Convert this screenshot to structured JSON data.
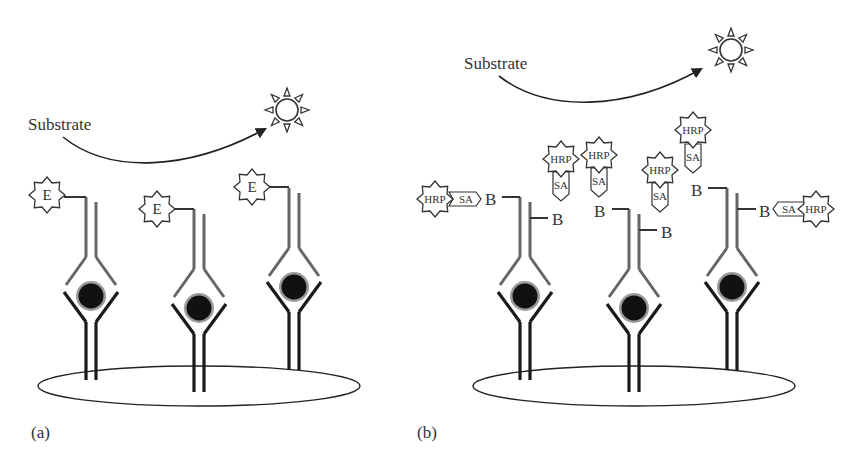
{
  "figure": {
    "panel_a": {
      "label": "(a)",
      "substrate_label": "Substrate",
      "enzyme_label": "E",
      "description": "Capture antibodies on a solid surface bind antigen; detection antibodies directly conjugated to enzyme (E) convert substrate to light signal",
      "antibodies": [
        {
          "x": 91,
          "offset": 0
        },
        {
          "x": 199,
          "offset": 12
        },
        {
          "x": 294,
          "offset": -10
        }
      ]
    },
    "panel_b": {
      "label": "(b)",
      "substrate_label": "Substrate",
      "biotin_label": "B",
      "streptavidin_label": "SA",
      "enzyme_label": "HRP",
      "description": "Biotinylated detection antibodies bind streptavidin-HRP conjugates, amplifying the signal",
      "antibodies": [
        {
          "x": 525,
          "offset": 0
        },
        {
          "x": 634,
          "offset": 12
        },
        {
          "x": 732,
          "offset": -10
        }
      ],
      "free_conjugates": 4,
      "bound_conjugates": 2
    },
    "colors": {
      "capture_antibody": "#1a1a1a",
      "detection_antibody": "#666666",
      "antigen": "#111111",
      "antigen_halo": "#9a9a9a",
      "outline": "#333333"
    }
  }
}
